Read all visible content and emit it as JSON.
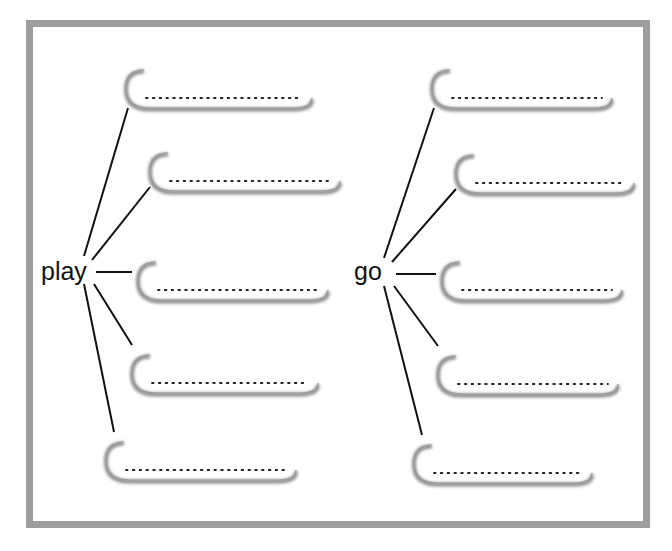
{
  "worksheet": {
    "frame_color": "#9e9e9e",
    "line_color": "#111111",
    "dots_placeholder": "........................",
    "groups": [
      {
        "word": "play",
        "word_pos": {
          "x": 42,
          "y": 258
        },
        "hub": {
          "x": 90,
          "y": 272
        },
        "blanks": [
          {
            "x": 126,
            "y": 70,
            "w": 186,
            "answer": ""
          },
          {
            "x": 150,
            "y": 153,
            "w": 190,
            "answer": ""
          },
          {
            "x": 138,
            "y": 262,
            "w": 190,
            "answer": ""
          },
          {
            "x": 132,
            "y": 355,
            "w": 186,
            "answer": ""
          },
          {
            "x": 106,
            "y": 442,
            "w": 190,
            "answer": ""
          }
        ]
      },
      {
        "word": "go",
        "word_pos": {
          "x": 355,
          "y": 258
        },
        "hub": {
          "x": 390,
          "y": 274
        },
        "blanks": [
          {
            "x": 432,
            "y": 70,
            "w": 180,
            "answer": ""
          },
          {
            "x": 456,
            "y": 155,
            "w": 178,
            "answer": ""
          },
          {
            "x": 442,
            "y": 262,
            "w": 180,
            "answer": ""
          },
          {
            "x": 438,
            "y": 356,
            "w": 180,
            "answer": ""
          },
          {
            "x": 414,
            "y": 445,
            "w": 178,
            "answer": ""
          }
        ]
      }
    ]
  }
}
